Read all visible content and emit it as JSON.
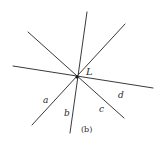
{
  "figure": {
    "caption": "(b)",
    "point_label": "L",
    "line_labels": {
      "a": "a",
      "b": "b",
      "c": "c",
      "d": "d"
    },
    "colors": {
      "background": "#ffffff",
      "stroke": "#3a3a3a",
      "text": "#2a2a2a"
    }
  }
}
